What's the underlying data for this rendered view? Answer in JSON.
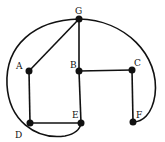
{
  "graph": {
    "nodes": [
      {
        "id": "G",
        "label": "G",
        "x": 79,
        "y": 19,
        "lx": 76,
        "ly": 14
      },
      {
        "id": "A",
        "label": "A",
        "x": 29,
        "y": 71,
        "lx": 16,
        "ly": 69
      },
      {
        "id": "B",
        "label": "B",
        "x": 79,
        "y": 71,
        "lx": 70,
        "ly": 68
      },
      {
        "id": "C",
        "label": "C",
        "x": 132,
        "y": 70,
        "lx": 135,
        "ly": 65
      },
      {
        "id": "D",
        "label": "D",
        "x": 30,
        "y": 123,
        "lx": 15,
        "ly": 138
      },
      {
        "id": "E",
        "label": "E",
        "x": 81,
        "y": 123,
        "lx": 72,
        "ly": 117
      },
      {
        "id": "F",
        "label": "F",
        "x": 133,
        "y": 122,
        "lx": 136,
        "ly": 117
      }
    ],
    "edges": [
      {
        "from": "G",
        "to": "A",
        "type": "straight"
      },
      {
        "from": "G",
        "to": "B",
        "type": "straight"
      },
      {
        "from": "B",
        "to": "E",
        "type": "straight"
      },
      {
        "from": "B",
        "to": "C",
        "type": "straight"
      },
      {
        "from": "C",
        "to": "F",
        "type": "straight"
      },
      {
        "from": "A",
        "to": "D",
        "type": "straight"
      },
      {
        "from": "D",
        "to": "E",
        "type": "straight"
      },
      {
        "from": "G",
        "to": "F",
        "type": "curve-right"
      },
      {
        "from": "G",
        "to": "E",
        "type": "curve-left"
      }
    ]
  }
}
